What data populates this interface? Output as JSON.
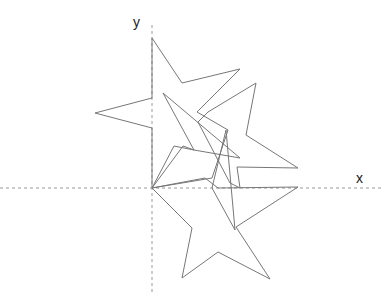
{
  "axes": {
    "x_label": "x",
    "y_label": "y",
    "origin": [
      152,
      188
    ]
  },
  "colors": {
    "stroke": "#777777",
    "axis": "#999999"
  },
  "shapes": [
    {
      "name": "star-upright-bottom",
      "points": "152,188 205,178 218,188 298,187 236,227 270,279 218,252 182,278 192,228 152,188"
    },
    {
      "name": "star-top",
      "points": "152,38 182,83 240,69 197,112 228,130 212,178 152,188 152,128 95,113 152,98 152,38"
    },
    {
      "name": "star-right",
      "points": "256,83 246,135 298,168 237,167 240,188 230,183 198,122 208,112 256,83"
    },
    {
      "name": "star-middle",
      "points": "163,93 240,158 194,150 183,146 152,188 174,146 194,150 163,93"
    },
    {
      "name": "star-thin",
      "points": "226,130 212,188 235,230 226,130"
    }
  ]
}
